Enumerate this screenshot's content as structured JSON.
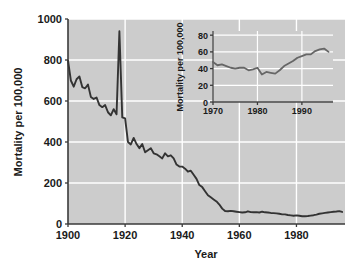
{
  "chart_data": {
    "type": "line",
    "title": "",
    "xlabel": "Year",
    "ylabel": "Mortality per 100,000",
    "xlim": [
      1900,
      1997
    ],
    "ylim": [
      0,
      1000
    ],
    "xticks": [
      1900,
      1920,
      1940,
      1960,
      1980
    ],
    "yticks": [
      0,
      200,
      400,
      600,
      800,
      1000
    ],
    "xtick_labels": [
      "1900",
      "1920",
      "1940",
      "1960",
      "1980"
    ],
    "ytick_labels": [
      "0",
      "200",
      "400",
      "600",
      "800",
      "1000"
    ],
    "grid": true,
    "grid_color": "#ffffff",
    "plot_background": "#cccccc",
    "line_color": "#333333",
    "legend": "none",
    "x": [
      1900,
      1901,
      1902,
      1903,
      1904,
      1905,
      1906,
      1907,
      1908,
      1909,
      1910,
      1911,
      1912,
      1913,
      1914,
      1915,
      1916,
      1917,
      1918,
      1919,
      1920,
      1921,
      1922,
      1923,
      1924,
      1925,
      1926,
      1927,
      1928,
      1929,
      1930,
      1931,
      1932,
      1933,
      1934,
      1935,
      1936,
      1937,
      1938,
      1939,
      1940,
      1941,
      1942,
      1943,
      1944,
      1945,
      1946,
      1947,
      1948,
      1949,
      1950,
      1951,
      1952,
      1953,
      1954,
      1955,
      1956,
      1957,
      1958,
      1959,
      1960,
      1961,
      1962,
      1963,
      1964,
      1965,
      1966,
      1967,
      1968,
      1969,
      1970,
      1971,
      1972,
      1973,
      1974,
      1975,
      1976,
      1977,
      1978,
      1979,
      1980,
      1981,
      1982,
      1983,
      1984,
      1985,
      1986,
      1987,
      1988,
      1989,
      1990,
      1991,
      1992,
      1993,
      1994,
      1995,
      1996
    ],
    "values": [
      797,
      700,
      670,
      706,
      720,
      668,
      662,
      680,
      620,
      610,
      617,
      580,
      570,
      580,
      545,
      530,
      560,
      535,
      940,
      520,
      515,
      400,
      388,
      420,
      390,
      370,
      390,
      350,
      360,
      370,
      345,
      340,
      330,
      320,
      345,
      330,
      335,
      320,
      290,
      280,
      280,
      270,
      255,
      260,
      240,
      220,
      190,
      180,
      160,
      140,
      130,
      120,
      110,
      95,
      75,
      63,
      62,
      64,
      62,
      60,
      58,
      56,
      57,
      62,
      58,
      57,
      58,
      56,
      60,
      57,
      56,
      54,
      53,
      52,
      50,
      47,
      47,
      44,
      42,
      40,
      42,
      40,
      38,
      38,
      39,
      41,
      43,
      46,
      50,
      52,
      54,
      56,
      58,
      60,
      61,
      63,
      59
    ]
  },
  "inset_chart_data": {
    "type": "line",
    "title": "",
    "xlabel": "",
    "ylabel": "Mortality per 100,000",
    "xlim": [
      1970,
      1997
    ],
    "ylim": [
      0,
      85
    ],
    "xticks": [
      1970,
      1980,
      1990
    ],
    "yticks": [
      0,
      20,
      40,
      60,
      80
    ],
    "xtick_labels": [
      "1970",
      "1980",
      "1990"
    ],
    "ytick_labels": [
      "0",
      "20",
      "40",
      "60",
      "80"
    ],
    "grid": true,
    "grid_color": "#ffffff",
    "plot_background": "#cccccc",
    "line_color": "#666666",
    "legend": "none",
    "x": [
      1970,
      1971,
      1972,
      1973,
      1974,
      1975,
      1976,
      1977,
      1978,
      1979,
      1980,
      1981,
      1982,
      1983,
      1984,
      1985,
      1986,
      1987,
      1988,
      1989,
      1990,
      1991,
      1992,
      1993,
      1994,
      1995,
      1996
    ],
    "values": [
      48,
      44,
      45,
      43,
      41,
      40,
      41,
      41,
      38,
      39,
      41,
      33,
      36,
      35,
      34,
      38,
      43,
      46,
      49,
      53,
      55,
      57,
      57,
      61,
      63,
      64,
      60
    ]
  },
  "axis_titles": {
    "main_y": "Mortality per 100,000",
    "main_x": "Year",
    "inset_y": "Mortality per 100,000"
  }
}
